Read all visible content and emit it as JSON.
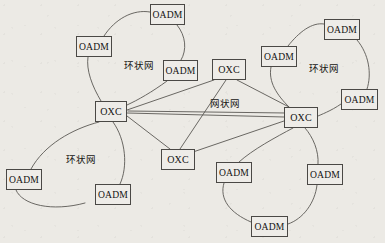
{
  "figure": {
    "type": "network-topology-diagram",
    "background_color": "#eceae5",
    "line_color": "#5a5854",
    "node_fill": "#eeece8",
    "node_border": "#4a4845",
    "width": 385,
    "height": 243
  },
  "zone_labels": [
    {
      "id": "ring-top-left",
      "text": "环状网",
      "meaning": "Ring Network",
      "x": 124,
      "y": 61
    },
    {
      "id": "ring-bottom-left",
      "text": "环状网",
      "meaning": "Ring Network",
      "x": 66,
      "y": 155
    },
    {
      "id": "ring-right",
      "text": "环状网",
      "meaning": "Ring Network",
      "x": 309,
      "y": 64
    },
    {
      "id": "mesh-center",
      "text": "网状网",
      "meaning": "Mesh Network",
      "x": 210,
      "y": 99
    }
  ],
  "nodes": [
    {
      "id": "oxc-left",
      "label": "OXC",
      "kind": "oxc",
      "x": 95,
      "y": 101,
      "w": 32,
      "h": 21
    },
    {
      "id": "oxc-top",
      "label": "OXC",
      "kind": "oxc",
      "x": 212,
      "y": 59,
      "w": 34,
      "h": 21
    },
    {
      "id": "oxc-right",
      "label": "OXC",
      "kind": "oxc",
      "x": 284,
      "y": 107,
      "w": 34,
      "h": 21
    },
    {
      "id": "oxc-bottom",
      "label": "OXC",
      "kind": "oxc",
      "x": 161,
      "y": 149,
      "w": 34,
      "h": 21
    },
    {
      "id": "oadm-tl-a",
      "label": "OADM",
      "kind": "oadm",
      "x": 150,
      "y": 4,
      "w": 35,
      "h": 21
    },
    {
      "id": "oadm-tl-b",
      "label": "OADM",
      "kind": "oadm",
      "x": 76,
      "y": 36,
      "w": 36,
      "h": 21
    },
    {
      "id": "oadm-tl-c",
      "label": "OADM",
      "kind": "oadm",
      "x": 163,
      "y": 60,
      "w": 35,
      "h": 21
    },
    {
      "id": "oadm-bl-a",
      "label": "OADM",
      "kind": "oadm",
      "x": 6,
      "y": 169,
      "w": 36,
      "h": 21
    },
    {
      "id": "oadm-bl-b",
      "label": "OADM",
      "kind": "oadm",
      "x": 95,
      "y": 184,
      "w": 36,
      "h": 21
    },
    {
      "id": "oadm-r-a",
      "label": "OADM",
      "kind": "oadm",
      "x": 324,
      "y": 19,
      "w": 36,
      "h": 21
    },
    {
      "id": "oadm-r-b",
      "label": "OADM",
      "kind": "oadm",
      "x": 261,
      "y": 46,
      "w": 36,
      "h": 21
    },
    {
      "id": "oadm-r-c",
      "label": "OADM",
      "kind": "oadm",
      "x": 341,
      "y": 89,
      "w": 37,
      "h": 21
    },
    {
      "id": "oadm-br-a",
      "label": "OADM",
      "kind": "oadm",
      "x": 216,
      "y": 162,
      "w": 36,
      "h": 21
    },
    {
      "id": "oadm-br-b",
      "label": "OADM",
      "kind": "oadm",
      "x": 307,
      "y": 164,
      "w": 36,
      "h": 21
    },
    {
      "id": "oadm-br-c",
      "label": "OADM",
      "kind": "oadm",
      "x": 251,
      "y": 216,
      "w": 37,
      "h": 21
    }
  ],
  "edges": {
    "mesh": [
      {
        "from": "oxc-left",
        "to": "oxc-top"
      },
      {
        "from": "oxc-left",
        "to": "oxc-right"
      },
      {
        "from": "oxc-left",
        "to": "oxc-bottom"
      },
      {
        "from": "oxc-top",
        "to": "oxc-right"
      },
      {
        "from": "oxc-top",
        "to": "oxc-bottom"
      },
      {
        "from": "oxc-right",
        "to": "oxc-bottom"
      }
    ],
    "ring_top_left": [
      "oxc-left",
      "oadm-tl-b",
      "oadm-tl-a",
      "oadm-tl-c",
      "oxc-left"
    ],
    "ring_bottom_left": [
      "oxc-left",
      "oadm-bl-a",
      "oadm-bl-b",
      "oxc-left"
    ],
    "ring_right": [
      "oxc-right",
      "oadm-r-b",
      "oadm-r-a",
      "oadm-r-c",
      "oxc-right"
    ],
    "ring_bottom_right": [
      "oxc-right",
      "oadm-br-a",
      "oadm-br-c",
      "oadm-br-b",
      "oxc-right"
    ]
  }
}
